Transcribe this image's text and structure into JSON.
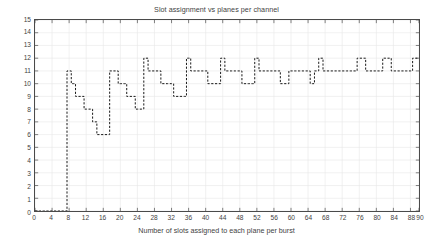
{
  "chart_data": {
    "type": "line",
    "title": "Slot assignment vs planes per channel",
    "xlabel": "Number of slots assigned to each plane per burst",
    "ylabel": "Number of planes per channel",
    "xlim": [
      0,
      90
    ],
    "ylim": [
      0,
      15
    ],
    "grid": true,
    "legend": null,
    "line_style": "dashed",
    "marker": "none",
    "color": "#1a1a1a",
    "xticks": [
      0,
      4,
      8,
      12,
      16,
      20,
      24,
      28,
      32,
      36,
      40,
      44,
      48,
      52,
      56,
      60,
      64,
      68,
      72,
      76,
      80,
      84,
      88,
      90
    ],
    "xtick_labels": [
      "0",
      "4",
      "8",
      "12",
      "16",
      "20",
      "24",
      "28",
      "32",
      "36",
      "40",
      "44",
      "48",
      "52",
      "56",
      "60",
      "64",
      "68",
      "72",
      "76",
      "80",
      "84",
      "88",
      "90"
    ],
    "yticks": [
      0,
      1,
      2,
      3,
      4,
      5,
      6,
      7,
      8,
      9,
      10,
      11,
      12,
      13,
      14,
      15
    ],
    "ytick_labels": [
      "0",
      "1",
      "2",
      "3",
      "4",
      "5",
      "6",
      "7",
      "8",
      "9",
      "10",
      "11",
      "12",
      "13",
      "14",
      "15"
    ],
    "x": [
      0,
      1,
      2,
      3,
      4,
      5,
      6,
      7,
      8,
      9,
      10,
      11,
      12,
      13,
      14,
      15,
      16,
      17,
      18,
      19,
      20,
      21,
      22,
      23,
      24,
      25,
      26,
      27,
      28,
      29,
      30,
      31,
      32,
      33,
      34,
      35,
      36,
      37,
      38,
      39,
      40,
      41,
      42,
      43,
      44,
      45,
      46,
      47,
      48,
      49,
      50,
      51,
      52,
      53,
      54,
      55,
      56,
      57,
      58,
      59,
      60,
      61,
      62,
      63,
      64,
      65,
      66,
      67,
      68,
      69,
      70,
      71,
      72,
      73,
      74,
      75,
      76,
      77,
      78,
      79,
      80,
      81,
      82,
      83,
      84,
      85,
      86,
      87,
      88,
      89,
      90
    ],
    "y": [
      0,
      0,
      0,
      0,
      0,
      0,
      0,
      0,
      11,
      10,
      9,
      9,
      8,
      8,
      7,
      6,
      6,
      6,
      11,
      11,
      10,
      10,
      9,
      9,
      8,
      8,
      12,
      11,
      11,
      11,
      10,
      10,
      10,
      9,
      9,
      9,
      12,
      11,
      11,
      11,
      11,
      10,
      10,
      10,
      12,
      11,
      11,
      11,
      11,
      10,
      10,
      10,
      12,
      11,
      11,
      11,
      11,
      11,
      10,
      10,
      11,
      11,
      11,
      11,
      11,
      10,
      11,
      12,
      11,
      11,
      11,
      11,
      11,
      11,
      11,
      11,
      12,
      12,
      11,
      11,
      11,
      11,
      12,
      12,
      11,
      11,
      11,
      11,
      11,
      12,
      12
    ],
    "series_name": "planes per channel"
  }
}
